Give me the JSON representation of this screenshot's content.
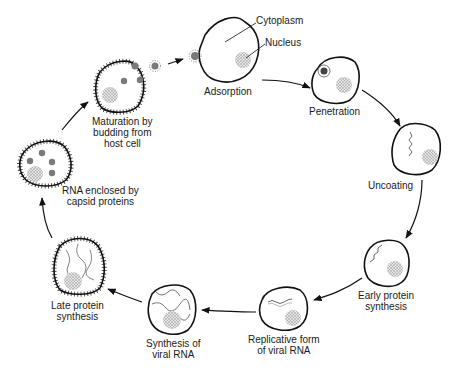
{
  "stages": [
    {
      "id": "adsorption",
      "label": "Adsorption"
    },
    {
      "id": "penetration",
      "label": "Penetration"
    },
    {
      "id": "uncoating",
      "label": "Uncoating"
    },
    {
      "id": "early-protein",
      "label": "Early protein\nsynthesis"
    },
    {
      "id": "replicative-form",
      "label": "Replicative form\nof viral RNA"
    },
    {
      "id": "synthesis-rna",
      "label": "Synthesis of\nviral RNA"
    },
    {
      "id": "late-protein",
      "label": "Late protein\nsynthesis"
    },
    {
      "id": "rna-enclosed",
      "label": "RNA enclosed by\ncapsid proteins"
    },
    {
      "id": "maturation",
      "label": "Maturation by\nbudding from\nhost cell"
    }
  ],
  "callouts": {
    "cytoplasm": "Cytoplasm",
    "nucleus": "Nucleus"
  },
  "colors": {
    "stroke": "#111111",
    "nucleus": "#bdbdbd",
    "virion": "#7a7a7a"
  }
}
